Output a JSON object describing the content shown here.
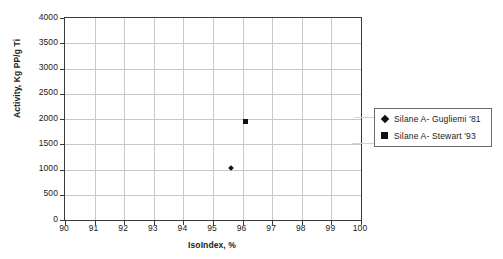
{
  "chart_data": {
    "type": "scatter",
    "title": "",
    "xlabel": "IsoIndex, %",
    "ylabel": "Activity, Kg PP/g Ti",
    "xlim": [
      90,
      100
    ],
    "ylim": [
      0,
      4000
    ],
    "xticks": [
      90,
      91,
      92,
      93,
      94,
      95,
      96,
      97,
      98,
      99,
      100
    ],
    "yticks": [
      0,
      500,
      1000,
      1500,
      2000,
      2500,
      3000,
      3500,
      4000
    ],
    "xtick_labels": [
      "90",
      "91",
      "92",
      "93",
      "94",
      "95",
      "96",
      "97",
      "98",
      "99",
      "100"
    ],
    "ytick_labels": [
      "0",
      "500",
      "1000",
      "1500",
      "2000",
      "2500",
      "3000",
      "3500",
      "4000"
    ],
    "grid": true,
    "grid_color": "#c8c8c8",
    "legend_position": "right-outside",
    "series": [
      {
        "name": "Silane A- Gugliemi '81",
        "marker": "diamond",
        "color": "#121212",
        "points": [
          {
            "x": 95.6,
            "y": 1030
          }
        ]
      },
      {
        "name": "Silane A- Stewart '93",
        "marker": "square",
        "color": "#121212",
        "points": [
          {
            "x": 96.1,
            "y": 1950
          }
        ]
      }
    ]
  },
  "legend": {
    "entries": [
      {
        "label": "Silane A- Gugliemi '81",
        "marker": "diamond"
      },
      {
        "label": "Silane A- Stewart '93",
        "marker": "square"
      }
    ]
  },
  "axes": {
    "x_title": "IsoIndex, %",
    "y_title": "Activity, Kg PP/g Ti"
  }
}
